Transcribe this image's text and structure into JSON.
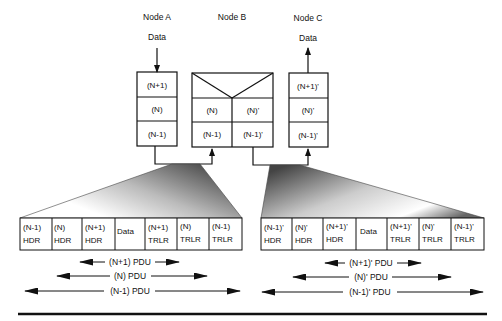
{
  "nodes": {
    "a": {
      "title": "Node A",
      "data_label": "Data",
      "layers": [
        "(N+1)",
        "(N)",
        "(N-1)"
      ]
    },
    "b": {
      "title": "Node B",
      "left_layers": [
        "(N)",
        "(N-1)"
      ],
      "right_layers": [
        "(N)'",
        "(N-1)'"
      ]
    },
    "c": {
      "title": "Node C",
      "data_label": "Data",
      "layers": [
        "(N+1)'",
        "(N)'",
        "(N-1)'"
      ]
    }
  },
  "left_frame": {
    "cells": [
      {
        "l1": "(N-1)",
        "l2": "HDR"
      },
      {
        "l1": "(N)",
        "l2": "HDR"
      },
      {
        "l1": "(N+1)",
        "l2": "HDR"
      },
      {
        "l1": "Data",
        "l2": ""
      },
      {
        "l1": "(N+1)",
        "l2": "TRLR"
      },
      {
        "l1": "(N)",
        "l2": "TRLR"
      },
      {
        "l1": "(N-1)",
        "l2": "TRLR"
      }
    ],
    "pdus": [
      "(N+1) PDU",
      "(N) PDU",
      "(N-1) PDU"
    ]
  },
  "right_frame": {
    "cells": [
      {
        "l1": "(N-1)'",
        "l2": "HDR"
      },
      {
        "l1": "(N)'",
        "l2": "HDR"
      },
      {
        "l1": "(N+1)'",
        "l2": "HDR"
      },
      {
        "l1": "Data",
        "l2": ""
      },
      {
        "l1": "(N+1)'",
        "l2": "TRLR"
      },
      {
        "l1": "(N)'",
        "l2": "TRLR"
      },
      {
        "l1": "(N-1)'",
        "l2": "TRLR"
      }
    ],
    "pdus": [
      "(N+1)' PDU",
      "(N)' PDU",
      "(N-1)' PDU"
    ]
  }
}
